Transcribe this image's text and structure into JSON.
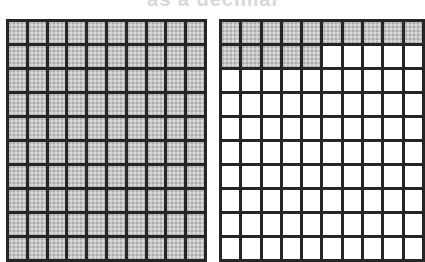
{
  "caption": "as a decimal",
  "colors": {
    "grid_line": "#262626",
    "shaded": "#c4c4c4",
    "unshaded": "#ffffff"
  },
  "grids": [
    {
      "name": "left-hundred-grid",
      "rows": 10,
      "cols": 10,
      "shaded_count": 100,
      "visible_rows": 10
    },
    {
      "name": "right-hundred-grid",
      "rows": 10,
      "cols": 10,
      "shaded_count": 15,
      "visible_rows": 10
    }
  ]
}
